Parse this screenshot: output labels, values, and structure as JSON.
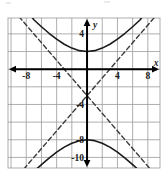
{
  "figure": {
    "axis_labels": {
      "x": "x",
      "y": "y"
    },
    "x_ticks": [
      {
        "value": -8,
        "label": "-8"
      },
      {
        "value": -4,
        "label": "-4"
      },
      {
        "value": 4,
        "label": "4"
      },
      {
        "value": 8,
        "label": "8"
      }
    ],
    "y_ticks": [
      {
        "value": 4,
        "label": "4"
      },
      {
        "value": -4,
        "label": "-4"
      },
      {
        "value": -8,
        "label": "-8"
      },
      {
        "value": -10,
        "label": "-10"
      }
    ]
  },
  "chart_data": {
    "type": "line",
    "title": "",
    "xlabel": "x",
    "ylabel": "y",
    "xlim": [
      -10.4,
      9.6
    ],
    "ylim": [
      -11.2,
      5.8
    ],
    "grid": true,
    "grid_step_x": 2,
    "grid_step_y": 2,
    "legend": "none",
    "curve_type": "hyperbola",
    "orientation": "vertical",
    "center": [
      0,
      -3
    ],
    "a": 5,
    "b": 5,
    "vertices": [
      [
        0,
        2
      ],
      [
        0,
        -8
      ]
    ],
    "equation": "y = -3 ± 5·sqrt(1 + x²/25)",
    "asymptote_slopes": [
      1,
      -1
    ],
    "asymptote_equations": [
      "y = x - 3",
      "y = -x - 3"
    ],
    "series": [
      {
        "name": "upper branch",
        "style": "solid",
        "color": "#1a1a1a",
        "points": [
          [
            -9.6,
            7.78
          ],
          [
            -9.0,
            7.44
          ],
          [
            -8.0,
            6.89
          ],
          [
            -7.0,
            5.6
          ],
          [
            -6.0,
            4.81
          ],
          [
            -5.0,
            4.07
          ],
          [
            -4.0,
            3.4
          ],
          [
            -3.0,
            2.83
          ],
          [
            -2.0,
            2.39
          ],
          [
            -1.0,
            2.1
          ],
          [
            0.0,
            2.0
          ],
          [
            1.0,
            2.1
          ],
          [
            2.0,
            2.39
          ],
          [
            3.0,
            2.83
          ],
          [
            4.0,
            3.4
          ],
          [
            5.0,
            4.07
          ],
          [
            6.0,
            4.81
          ],
          [
            7.0,
            5.6
          ],
          [
            8.0,
            6.89
          ],
          [
            9.6,
            7.78
          ]
        ]
      },
      {
        "name": "lower branch",
        "style": "solid",
        "color": "#1a1a1a",
        "points": [
          [
            -9.6,
            -13.78
          ],
          [
            -9.0,
            -13.44
          ],
          [
            -8.0,
            -12.89
          ],
          [
            -7.0,
            -11.6
          ],
          [
            -6.0,
            -10.81
          ],
          [
            -5.0,
            -10.07
          ],
          [
            -4.0,
            -9.4
          ],
          [
            -3.0,
            -8.83
          ],
          [
            -2.0,
            -8.39
          ],
          [
            -1.0,
            -8.1
          ],
          [
            0.0,
            -8.0
          ],
          [
            1.0,
            -8.1
          ],
          [
            2.0,
            -8.39
          ],
          [
            3.0,
            -8.83
          ],
          [
            4.0,
            -9.4
          ],
          [
            5.0,
            -10.07
          ],
          [
            6.0,
            -10.81
          ],
          [
            7.0,
            -11.6
          ],
          [
            8.0,
            -12.89
          ],
          [
            9.6,
            -13.78
          ]
        ]
      },
      {
        "name": "asymptote positive slope",
        "style": "dashed",
        "color": "#3a3a3a",
        "points": [
          [
            -9.6,
            -12.6
          ],
          [
            9.6,
            6.6
          ]
        ]
      },
      {
        "name": "asymptote negative slope",
        "style": "dashed",
        "color": "#3a3a3a",
        "points": [
          [
            -9.6,
            6.6
          ],
          [
            9.6,
            -12.6
          ]
        ]
      }
    ]
  }
}
